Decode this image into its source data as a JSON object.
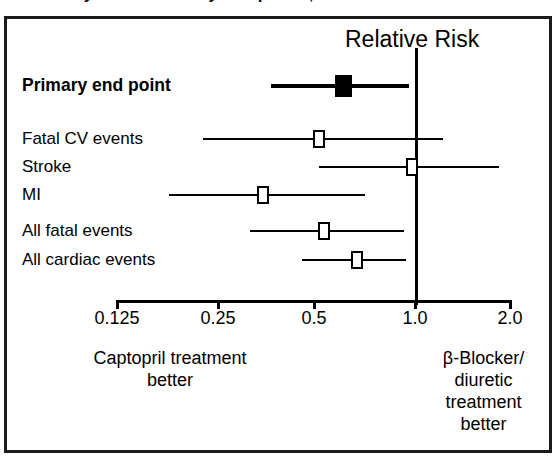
{
  "figure": {
    "clipped_title": "Primary and secondary end points, CAPPP",
    "axis_title": "Relative Risk",
    "caption_left": "Captopril treatment\nbetter",
    "caption_right": "β-Blocker/\ndiuretic\ntreatment\nbetter",
    "frame_color": "#1a1a1a",
    "marker_fill_primary": "#000000",
    "marker_fill_secondary": "#ffffff"
  },
  "chart_data": {
    "type": "scatter",
    "subtype": "forest-plot",
    "title": "Relative Risk",
    "xlabel": "Relative Risk",
    "ylabel": "",
    "xscale": "log2",
    "xlim": [
      0.125,
      2.0
    ],
    "xticks": [
      0.125,
      0.25,
      0.5,
      1.0,
      2.0
    ],
    "xticklabels": [
      "0.125",
      "0.25",
      "0.5",
      "1.0",
      "2.0"
    ],
    "grid": false,
    "reference_line": 1.0,
    "legend": "none",
    "annotations": {
      "left_of_reference": "Captopril treatment better",
      "right_of_reference": "β-Blocker/diuretic treatment better"
    },
    "categories": [
      "Primary end point",
      "Fatal CV events",
      "Stroke",
      "MI",
      "All fatal events",
      "All cardiac events"
    ],
    "points": [
      {
        "label": "Primary end point",
        "estimate": 0.62,
        "ci_low": 0.37,
        "ci_high": 0.98,
        "marker": "filled-square",
        "emphasis": "bold"
      },
      {
        "label": "Fatal CV events",
        "estimate": 0.52,
        "ci_low": 0.23,
        "ci_high": 1.25,
        "marker": "open-square",
        "emphasis": "normal"
      },
      {
        "label": "Stroke",
        "estimate": 1.0,
        "ci_low": 0.52,
        "ci_high": 1.85,
        "marker": "open-square",
        "emphasis": "normal"
      },
      {
        "label": "MI",
        "estimate": 0.35,
        "ci_low": 0.18,
        "ci_high": 0.72,
        "marker": "open-square",
        "emphasis": "normal"
      },
      {
        "label": "All fatal events",
        "estimate": 0.54,
        "ci_low": 0.32,
        "ci_high": 0.95,
        "marker": "open-square",
        "emphasis": "normal"
      },
      {
        "label": "All cardiac events",
        "estimate": 0.68,
        "ci_low": 0.46,
        "ci_high": 0.96,
        "marker": "open-square",
        "emphasis": "normal"
      }
    ]
  },
  "geometry": {
    "rows_y": [
      86,
      139,
      167,
      195,
      231,
      260
    ],
    "label_x": 22,
    "axis_y": 300,
    "axis_left_px": 117,
    "axis_right_px": 510,
    "tick_px": [
      117,
      218,
      314,
      415,
      510
    ],
    "ref_line_px": 416,
    "ref_line_top": 48,
    "ref_line_bottom": 305,
    "tick_label_y": 308,
    "axis_title_x": 345,
    "axis_title_y": 26,
    "caption_left_x": 170,
    "caption_right_x": 416,
    "caption_y": 348
  }
}
